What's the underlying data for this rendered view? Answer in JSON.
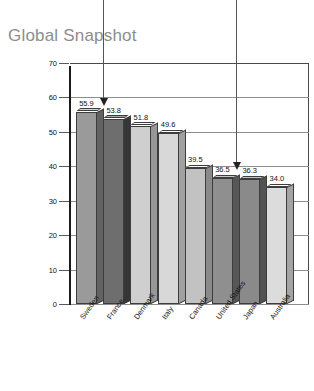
{
  "chart_data": {
    "type": "bar",
    "title": "Global Snapshot",
    "xlabel": "",
    "ylabel": "Government Expenditures as Percentage of Gross Domestic Product",
    "ylim": [
      0,
      70
    ],
    "yticks": [
      0,
      10,
      20,
      30,
      40,
      50,
      60,
      70
    ],
    "ytick_labels": [
      "0",
      "10",
      "20",
      "30",
      "40",
      "50",
      "60",
      "70"
    ],
    "grid": true,
    "legend": "none",
    "categories": [
      "Sweden",
      "France",
      "Denmark",
      "Italy",
      "Canada",
      "United States",
      "Japan",
      "Australia"
    ],
    "values": [
      55.9,
      53.8,
      51.8,
      49.6,
      39.5,
      36.5,
      36.3,
      34.0
    ],
    "value_labels": [
      "55.9",
      "53.8",
      "51.8",
      "49.6",
      "39.5",
      "36.5",
      "36.3",
      "34.0"
    ],
    "bar_colors": [
      "#9a9a9a",
      "#6e6e6e",
      "#cfcfcf",
      "#d8d8d8",
      "#c2c2c2",
      "#8f8f8f",
      "#8a8a8a",
      "#dcdcdc"
    ],
    "annotations": [
      {
        "target": "Sweden",
        "label": ""
      },
      {
        "target": "United States",
        "label": ""
      }
    ]
  },
  "colors": {
    "title": "#8d8d8d",
    "axis": "#1a1a1a",
    "grid": "#8e8e8e",
    "text": "#111111",
    "arrow": "#222222",
    "background": "#ffffff"
  }
}
